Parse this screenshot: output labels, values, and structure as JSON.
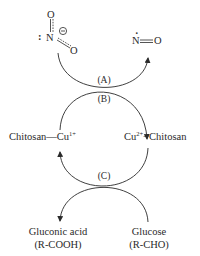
{
  "diagram": {
    "type": "catalytic-cycle",
    "reactants": {
      "nitrite": {
        "atoms": [
          "N",
          "O",
          "O"
        ],
        "charge_symbol": "−",
        "lone_pair": ":"
      },
      "nitric_oxide": {
        "n": "N",
        "o": "O",
        "radical_dot": "·"
      }
    },
    "steps": {
      "a": "(A)",
      "b": "(B)",
      "c": "(C)"
    },
    "species": {
      "chitosan_cu1": {
        "left": "Chitosan",
        "bond": "—",
        "metal": "Cu",
        "charge": "1+"
      },
      "cu2_chitosan": {
        "metal": "Cu",
        "charge": "2+",
        "bond": "−",
        "right": "Chitosan"
      },
      "gluconic_acid": {
        "name": "Gluconic acid",
        "formula": "(R-COOH)"
      },
      "glucose": {
        "name": "Glucose",
        "formula": "(R-CHO)"
      }
    },
    "colors": {
      "ink": "#2a2a2a",
      "background": "#ffffff"
    }
  }
}
